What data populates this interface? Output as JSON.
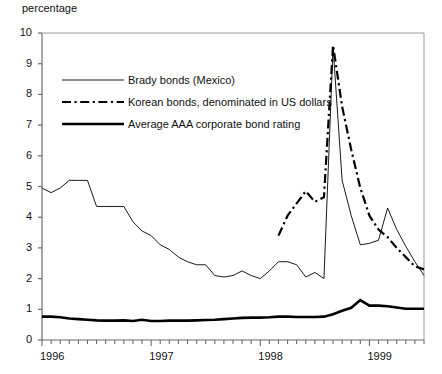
{
  "chart_data": {
    "type": "line",
    "title": "",
    "ylabel": "percentage",
    "xlabel": "",
    "ylim": [
      0,
      10
    ],
    "yticks": [
      0,
      1,
      2,
      3,
      4,
      5,
      6,
      7,
      8,
      9,
      10
    ],
    "ytick_labels": [
      "0",
      "1",
      "2",
      "3",
      "4",
      "5",
      "6",
      "7",
      "8",
      "9",
      "10"
    ],
    "xlim": [
      "1996-01",
      "1999-07"
    ],
    "xtick_labels": [
      "1996",
      "1997",
      "1998",
      "1999"
    ],
    "xtick_positions": [
      "1996-01",
      "1997-01",
      "1998-01",
      "1999-01"
    ],
    "minor_xticks_per_year": 12,
    "grid": false,
    "legend_position": "upper-left-inside",
    "series": [
      {
        "name": "Brady bonds (Mexico)",
        "style": "solid-thin",
        "x": [
          "1996-01",
          "1996-02",
          "1996-03",
          "1996-04",
          "1996-05",
          "1996-06",
          "1996-07",
          "1996-08",
          "1996-09",
          "1996-10",
          "1996-11",
          "1996-12",
          "1997-01",
          "1997-02",
          "1997-03",
          "1997-04",
          "1997-05",
          "1997-06",
          "1997-07",
          "1997-08",
          "1997-09",
          "1997-10",
          "1997-11",
          "1997-12",
          "1998-01",
          "1998-02",
          "1998-03",
          "1998-04",
          "1998-05",
          "1998-06",
          "1998-07",
          "1998-08",
          "1998-09",
          "1998-10",
          "1998-11",
          "1998-12",
          "1999-01",
          "1999-02",
          "1999-03",
          "1999-04",
          "1999-05",
          "1999-06",
          "1999-07"
        ],
        "values": [
          4.95,
          4.8,
          4.95,
          5.2,
          5.2,
          5.2,
          4.35,
          4.35,
          4.35,
          4.35,
          3.85,
          3.55,
          3.4,
          3.1,
          2.95,
          2.7,
          2.55,
          2.45,
          2.45,
          2.1,
          2.05,
          2.1,
          2.25,
          2.1,
          2.0,
          2.25,
          2.55,
          2.55,
          2.45,
          2.05,
          2.2,
          2.0,
          9.55,
          5.2,
          4.05,
          3.1,
          3.15,
          3.25,
          4.3,
          3.6,
          3.05,
          2.55,
          2.1
        ]
      },
      {
        "name": "Korean bonds, denominated in US dollars",
        "style": "dash-dot-thick",
        "x": [
          "1998-03",
          "1998-04",
          "1998-05",
          "1998-06",
          "1998-07",
          "1998-08",
          "1998-09",
          "1998-10",
          "1998-11",
          "1998-12",
          "1999-01",
          "1999-02",
          "1999-03",
          "1999-04",
          "1999-05",
          "1999-06",
          "1999-07"
        ],
        "values": [
          3.4,
          4.05,
          4.45,
          4.85,
          4.5,
          4.65,
          9.6,
          7.6,
          6.2,
          4.95,
          4.05,
          3.6,
          3.35,
          3.0,
          2.7,
          2.4,
          2.3
        ]
      },
      {
        "name": "Average AAA corporate bond rating",
        "style": "solid-thick",
        "x": [
          "1996-01",
          "1996-02",
          "1996-03",
          "1996-04",
          "1996-05",
          "1996-06",
          "1996-07",
          "1996-08",
          "1996-09",
          "1996-10",
          "1996-11",
          "1996-12",
          "1997-01",
          "1997-02",
          "1997-03",
          "1997-04",
          "1997-05",
          "1997-06",
          "1997-07",
          "1997-08",
          "1997-09",
          "1997-10",
          "1997-11",
          "1997-12",
          "1998-01",
          "1998-02",
          "1998-03",
          "1998-04",
          "1998-05",
          "1998-06",
          "1998-07",
          "1998-08",
          "1998-09",
          "1998-10",
          "1998-11",
          "1998-12",
          "1999-01",
          "1999-02",
          "1999-03",
          "1999-04",
          "1999-05",
          "1999-06",
          "1999-07"
        ],
        "values": [
          0.76,
          0.76,
          0.74,
          0.7,
          0.68,
          0.66,
          0.64,
          0.63,
          0.63,
          0.64,
          0.62,
          0.66,
          0.62,
          0.62,
          0.63,
          0.63,
          0.63,
          0.64,
          0.65,
          0.66,
          0.68,
          0.7,
          0.72,
          0.73,
          0.73,
          0.74,
          0.76,
          0.76,
          0.75,
          0.75,
          0.75,
          0.76,
          0.84,
          0.95,
          1.05,
          1.3,
          1.12,
          1.12,
          1.1,
          1.06,
          1.02,
          1.02,
          1.02
        ]
      }
    ]
  },
  "legend": {
    "items": [
      {
        "label": "Brady bonds (Mexico)",
        "swatch": "solid-thin"
      },
      {
        "label": "Korean bonds, denominated in US dollars",
        "swatch": "dash-dot-thick"
      },
      {
        "label": "Average AAA corporate bond rating",
        "swatch": "solid-thick"
      }
    ]
  },
  "colors": {
    "line": "#000000",
    "axis": "#6b6b6b",
    "background": "#ffffff"
  }
}
